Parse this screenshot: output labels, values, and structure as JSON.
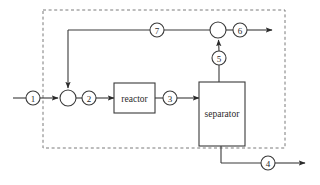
{
  "diagram": {
    "system_boundary": {
      "name": "system-boundary",
      "style": "dashed",
      "x": 43,
      "y": 10,
      "width": 242,
      "height": 138,
      "color": "#7a7a7a"
    },
    "line_color": "#3a3a3a",
    "fill_color": "#ffffff",
    "units": [
      {
        "id": "reactor",
        "label": "reactor",
        "x": 114,
        "y": 83,
        "width": 41,
        "height": 30
      },
      {
        "id": "separator",
        "label": "separator",
        "x": 199,
        "y": 82,
        "width": 46,
        "height": 64
      }
    ],
    "junctions": [
      {
        "id": "mixer",
        "label": "",
        "cx": 68,
        "cy": 98,
        "r": 8
      },
      {
        "id": "splitter",
        "label": "",
        "cx": 218,
        "cy": 30,
        "r": 8
      }
    ],
    "streams": [
      {
        "id": "stream-1",
        "label": "1",
        "cx": 33,
        "cy": 98,
        "r": 7
      },
      {
        "id": "stream-2",
        "label": "2",
        "cx": 89,
        "cy": 98,
        "r": 7
      },
      {
        "id": "stream-3",
        "label": "3",
        "cx": 170,
        "cy": 98,
        "r": 7
      },
      {
        "id": "stream-4",
        "label": "4",
        "cx": 268,
        "cy": 163,
        "r": 7
      },
      {
        "id": "stream-5",
        "label": "5",
        "cx": 219,
        "cy": 58,
        "r": 7
      },
      {
        "id": "stream-6",
        "label": "6",
        "cx": 240,
        "cy": 30,
        "r": 7
      },
      {
        "id": "stream-7",
        "label": "7",
        "cx": 157,
        "cy": 30,
        "r": 7
      }
    ]
  }
}
